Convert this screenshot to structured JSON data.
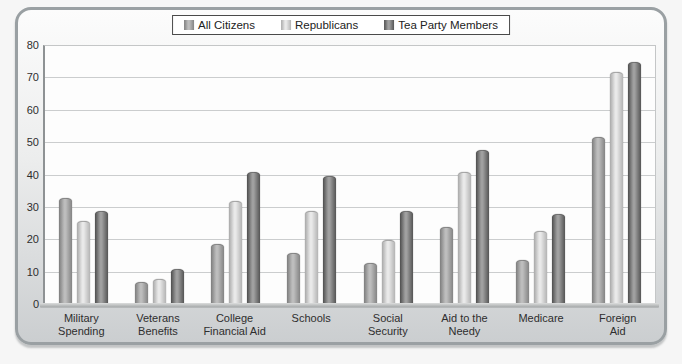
{
  "panel": {
    "background_top": "#fcfcfc",
    "background_bottom": "#cbced0",
    "border_color": "#9aa0a3"
  },
  "chart_data": {
    "type": "bar",
    "title": "",
    "categories": [
      "Military\nSpending",
      "Veterans\nBenefits",
      "College\nFinancial Aid",
      "Schools",
      "Social\nSecurity",
      "Aid to the\nNeedy",
      "Medicare",
      "Foreign\nAid"
    ],
    "series": [
      {
        "name": "All Citizens",
        "color": "#9c9c9c",
        "gradient": [
          "#7d7d7d",
          "#bdbdbd",
          "#848484"
        ],
        "values": [
          33,
          7,
          19,
          16,
          13,
          24,
          14,
          52
        ]
      },
      {
        "name": "Republicans",
        "color": "#d3d3d3",
        "gradient": [
          "#a9a9a9",
          "#e9e9e9",
          "#b4b4b4"
        ],
        "values": [
          26,
          8,
          32,
          29,
          20,
          41,
          23,
          72
        ]
      },
      {
        "name": "Tea Party Members",
        "color": "#6e6e6e",
        "gradient": [
          "#4e4e4e",
          "#a0a0a0",
          "#555555"
        ],
        "values": [
          29,
          11,
          41,
          40,
          29,
          48,
          28,
          75
        ]
      }
    ],
    "ylim": [
      0,
      80
    ],
    "ytick_step": 10,
    "ytick_labels": [
      "0",
      "10",
      "20",
      "30",
      "40",
      "50",
      "60",
      "70",
      "80"
    ],
    "grid": true,
    "grid_color": "#cbcdce",
    "plot_background": "#fdfdfd",
    "legend_position": "top-center",
    "xlabel": "",
    "ylabel": "",
    "text_color": "#2e2e2e"
  }
}
